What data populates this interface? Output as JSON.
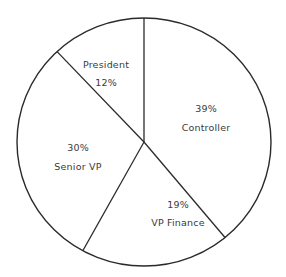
{
  "chart_data": {
    "type": "pie",
    "title": "",
    "slices": [
      {
        "name": "President",
        "value": 12,
        "label": "12%"
      },
      {
        "name": "Controller",
        "value": 39,
        "label": "39%"
      },
      {
        "name": "VP Finance",
        "value": 19,
        "label": "19%"
      },
      {
        "name": "Senior VP",
        "value": 30,
        "label": "30%"
      }
    ],
    "categories": [
      "President",
      "Controller",
      "VP Finance",
      "Senior VP"
    ],
    "values": [
      12,
      39,
      19,
      30
    ],
    "legend": "none (labels inside slices)",
    "fill": "#ffffff",
    "stroke": "#2a2a2a"
  },
  "labels": {
    "president": {
      "name": "President",
      "pct": "12%"
    },
    "controller": {
      "name": "Controller",
      "pct": "39%"
    },
    "vp_finance": {
      "name": "VP Finance",
      "pct": "19%"
    },
    "senior_vp": {
      "name": "Senior VP",
      "pct": "30%"
    }
  }
}
